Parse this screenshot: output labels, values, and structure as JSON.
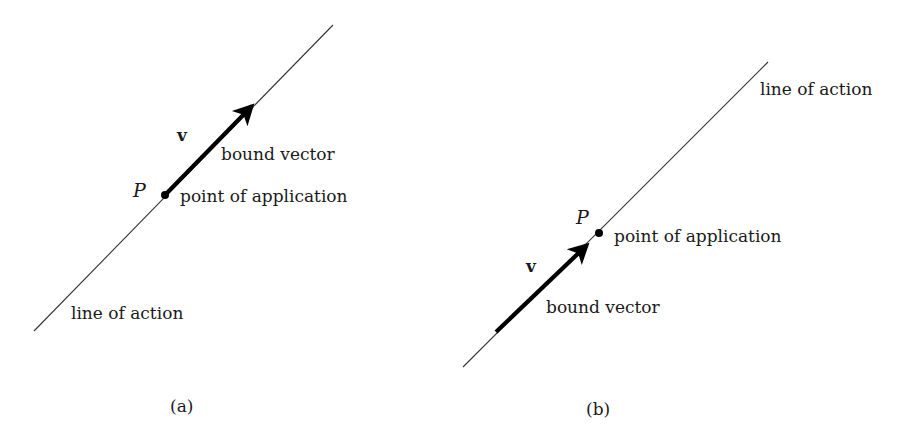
{
  "panels": [
    {
      "id": "a",
      "caption": "(a)",
      "labels": {
        "vector": "v",
        "point": "P",
        "bound_vector": "bound vector",
        "point_of_application": "point of application",
        "line_of_action": "line of action"
      }
    },
    {
      "id": "b",
      "caption": "(b)",
      "labels": {
        "vector": "v",
        "point": "P",
        "bound_vector": "bound vector",
        "point_of_application": "point of application",
        "line_of_action": "line of action"
      }
    }
  ],
  "colors": {
    "line": "#333333",
    "vector": "#000000",
    "text": "#1a1a1a",
    "background": "#ffffff"
  }
}
